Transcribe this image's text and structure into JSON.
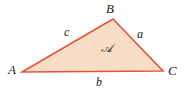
{
  "figure": {
    "type": "geometry-diagram",
    "background_color": "#ffffff",
    "stroke_color": "#e0553a",
    "fill_color": "#f7ddc6",
    "label_color": "#1a1a1a",
    "stroke_width": 1.6
  },
  "triangle": {
    "vertices": [
      {
        "name": "A",
        "label": "A",
        "x": 22,
        "y": 72
      },
      {
        "name": "B",
        "label": "B",
        "x": 113,
        "y": 19
      },
      {
        "name": "C",
        "label": "C",
        "x": 163,
        "y": 71
      }
    ],
    "sides": [
      {
        "name": "a",
        "label": "a",
        "between": "B-C"
      },
      {
        "name": "b",
        "label": "b",
        "between": "A-C"
      },
      {
        "name": "c",
        "label": "c",
        "between": "A-B"
      }
    ],
    "interior": {
      "name": "area",
      "label": "𝒜"
    }
  }
}
